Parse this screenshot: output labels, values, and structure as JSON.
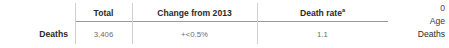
{
  "table": {
    "row_label": "Deaths",
    "columns": [
      {
        "header": "Total",
        "footnote": ""
      },
      {
        "header": "Change from 2013",
        "footnote": ""
      },
      {
        "header": "Death rate",
        "footnote": "a"
      }
    ],
    "rows": [
      {
        "label": "Deaths",
        "total": "3,406",
        "change_from_2013": "+<0.5%",
        "death_rate": "1.1"
      }
    ]
  },
  "side_panel": {
    "tick_value": "0",
    "axis_label": "Age",
    "series_label": "Deaths"
  },
  "colors": {
    "background": "#ffffff",
    "header_text": "#2a2a2a",
    "value_text": "#6e6e6e",
    "rule": "#9a9a9a",
    "divider": "#d2d2d2"
  }
}
